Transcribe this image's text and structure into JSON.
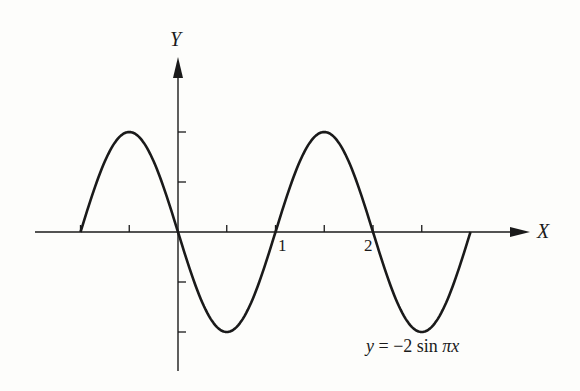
{
  "chart_data": {
    "type": "line",
    "title": "",
    "equation_label": "y = −2 sin πx",
    "xlabel": "X",
    "ylabel": "Y",
    "function": "y = -2*sin(pi*x)",
    "x_range_plotted": [
      -1,
      3
    ],
    "xlim": [
      -1.5,
      3.6
    ],
    "ylim": [
      -2.8,
      3.6
    ],
    "x_ticks": [
      -1,
      -0.5,
      0.5,
      1,
      1.5,
      2,
      2.5
    ],
    "x_tick_labels": {
      "1": "1",
      "2": "2"
    },
    "y_ticks": [
      -2,
      -1,
      1,
      2
    ],
    "y_tick_labels": {},
    "grid": false,
    "legend": null,
    "series": [
      {
        "name": "y = −2 sin πx",
        "x": [
          -1,
          -0.75,
          -0.5,
          -0.25,
          0,
          0.25,
          0.5,
          0.75,
          1,
          1.25,
          1.5,
          1.75,
          2,
          2.25,
          2.5,
          2.75,
          3
        ],
        "y": [
          0,
          1.414,
          2,
          1.414,
          0,
          -1.414,
          -2,
          -1.414,
          0,
          1.414,
          2,
          1.414,
          0,
          -1.414,
          -2,
          -1.414,
          0
        ]
      }
    ]
  },
  "labels": {
    "x_axis": "X",
    "y_axis": "Y",
    "tick_1": "1",
    "tick_2": "2",
    "equation_lhs": "y",
    "equation_rhs": "= −2 sin ",
    "equation_pi": "π",
    "equation_var": "x"
  },
  "colors": {
    "ink": "#1a1a1a",
    "paper": "#fdfdfb"
  }
}
